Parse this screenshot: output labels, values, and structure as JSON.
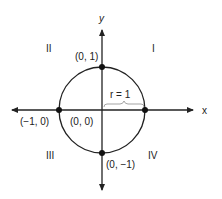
{
  "axes": {
    "x_label": "x",
    "y_label": "y"
  },
  "quadrants": {
    "q1": "I",
    "q2": "II",
    "q3": "III",
    "q4": "IV"
  },
  "points": {
    "top": "(0, 1)",
    "bottom": "(0, −1)",
    "left": "(−1, 0)",
    "origin": "(0, 0)"
  },
  "radius_label": "r = 1",
  "colors": {
    "stroke": "#222222"
  }
}
